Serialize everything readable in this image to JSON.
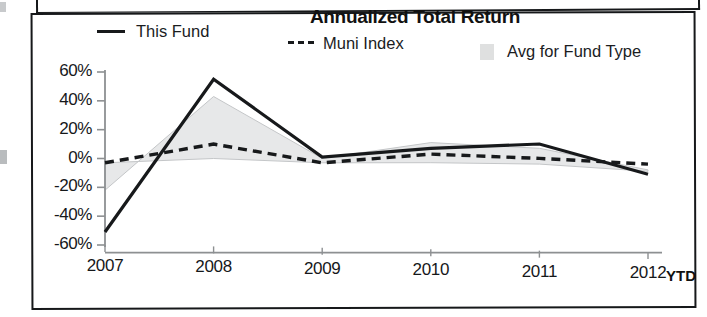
{
  "chart_data": {
    "type": "line",
    "title": "Annualized Total Return",
    "xlabel": "",
    "ylabel": "",
    "categories": [
      "2007",
      "2008",
      "2009",
      "2010",
      "2011",
      "2012"
    ],
    "x_axis_suffix_label": "YTD",
    "ytick_labels": [
      "60%",
      "40%",
      "20%",
      "0%",
      "-20%",
      "-40%",
      "-60%"
    ],
    "ytick_values": [
      60,
      40,
      20,
      0,
      -20,
      -40,
      -60
    ],
    "ylim": [
      -60,
      60
    ],
    "grid": false,
    "legend_position": "top",
    "series": [
      {
        "name": "This Fund",
        "style": "solid",
        "color": "#17191b",
        "values": [
          -51,
          56,
          3,
          10,
          14,
          -6
        ]
      },
      {
        "name": "Muni Index",
        "style": "dashed",
        "color": "#17191b",
        "values": [
          -3,
          11,
          -1,
          6,
          4,
          1
        ]
      },
      {
        "name": "Avg for Fund Type",
        "style": "area-band",
        "color": "#d9dadb",
        "band_upper": [
          -22,
          44,
          2,
          14,
          11,
          -3
        ],
        "band_lower": [
          -3,
          1,
          -1,
          0,
          0,
          -4
        ]
      }
    ]
  },
  "chart": {
    "title": "Annualized Total Return",
    "legend": [
      {
        "label": "This Fund",
        "marker": "solid-line"
      },
      {
        "label": "Muni Index",
        "marker": "dashed-line"
      },
      {
        "label": "Avg for Fund Type",
        "marker": "gray-swatch"
      }
    ],
    "y_axis": {
      "ticks": [
        "60%",
        "40%",
        "20%",
        "0%",
        "-20%",
        "-40%",
        "-60%"
      ]
    },
    "x_axis": {
      "ticks": [
        "2007",
        "2008",
        "2009",
        "2010",
        "2011",
        "2012"
      ],
      "suffix": "YTD"
    }
  },
  "colors": {
    "line": "#17191b",
    "band": "#d9dadb",
    "axis": "#8d9092",
    "frame": "#16181a",
    "background": "#ffffff"
  }
}
